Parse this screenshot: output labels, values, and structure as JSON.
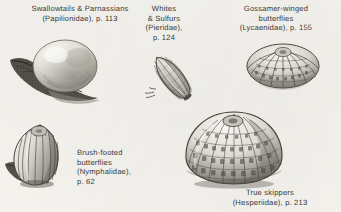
{
  "plate": {
    "kind": "book-plate-illustration",
    "subject": "butterfly egg types",
    "background_color": "#f6f4ef",
    "ink_color": "#3a3a38"
  },
  "captions": {
    "papilionidae": {
      "line1": "Swallowtails & Parnassians",
      "line2": "(Papilionidae), p. 113"
    },
    "pieridae": {
      "line1": "Whites",
      "line2": "& Sulfurs",
      "line3": "(Pieridae),",
      "line4": "p. 124"
    },
    "lycaenidae": {
      "line1": "Gossamer-winged",
      "line2": "butterflies",
      "line3": "(Lycaenidae), p. 155"
    },
    "nymphalidae": {
      "line1": "Brush-footed",
      "line2": "butterflies",
      "line3": "(Nymphalidae),",
      "line4": "p. 62"
    },
    "hesperiidae": {
      "line1": "True skippers",
      "line2": "(Hesperiidae), p. 213"
    }
  },
  "figures": {
    "papilionidae": {
      "name": "papilionidae-egg-illustration"
    },
    "pieridae": {
      "name": "pieridae-egg-illustration"
    },
    "lycaenidae": {
      "name": "lycaenidae-egg-illustration"
    },
    "nymphalidae": {
      "name": "nymphalidae-egg-illustration"
    },
    "hesperiidae": {
      "name": "hesperiidae-egg-illustration"
    }
  }
}
